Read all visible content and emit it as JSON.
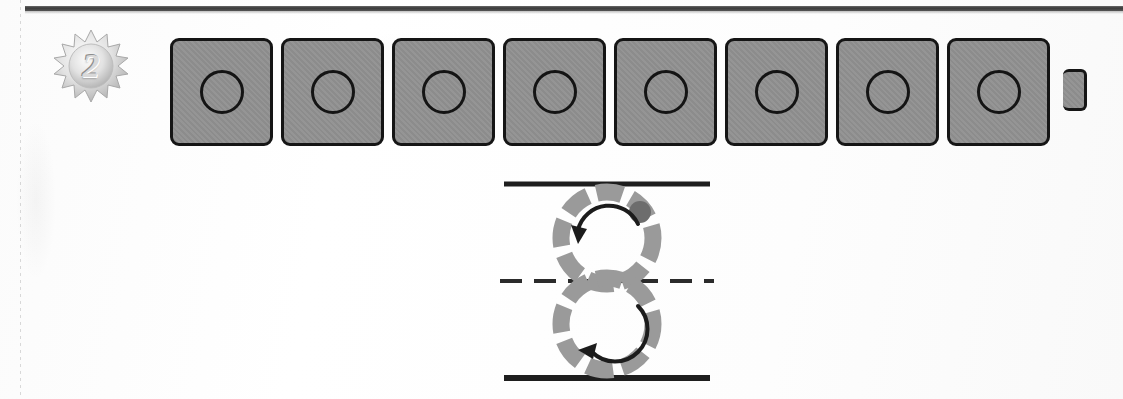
{
  "figure": {
    "panel_number": "2",
    "badge": {
      "icon": "sunburst-badge-icon",
      "label": "2"
    },
    "top_rule": {
      "visible": true,
      "style": "solid"
    }
  },
  "strip": {
    "name": "perforated-tile-strip",
    "tile_count": 8,
    "tile_fill": "#919191",
    "tile_border": "#151515",
    "hole_shape": "circle",
    "hole_border": "#141414",
    "has_end_tab": true,
    "tiles": [
      {
        "index": 1,
        "label": "",
        "hole": "circle"
      },
      {
        "index": 2,
        "label": "",
        "hole": "circle"
      },
      {
        "index": 3,
        "label": "",
        "hole": "circle"
      },
      {
        "index": 4,
        "label": "",
        "hole": "circle"
      },
      {
        "index": 5,
        "label": "",
        "hole": "circle"
      },
      {
        "index": 6,
        "label": "",
        "hole": "circle"
      },
      {
        "index": 7,
        "label": "",
        "hole": "circle"
      },
      {
        "index": 8,
        "label": "",
        "hole": "circle"
      }
    ]
  },
  "diagram": {
    "name": "counter-rotating-wheels-diagram",
    "segment_color": "#9a9a9a",
    "marker_color": "#6d6d6d",
    "line_color": "#1e1e1e",
    "lines": [
      {
        "id": "top-rail",
        "style": "solid",
        "label": ""
      },
      {
        "id": "center-axis",
        "style": "dashed",
        "label": ""
      },
      {
        "id": "bottom-rail",
        "style": "solid",
        "label": ""
      }
    ],
    "wheels": [
      {
        "id": "upper-wheel",
        "segments": 8,
        "rotation": "counter-clockwise",
        "arrow": "curved-arrow-ccw",
        "marker": {
          "present": true,
          "position": "upper-right"
        }
      },
      {
        "id": "lower-wheel",
        "segments": 8,
        "rotation": "counter-clockwise",
        "arrow": "curved-arrow-ccw",
        "marker": {
          "present": false,
          "position": ""
        }
      }
    ]
  },
  "colors": {
    "paper": "#fefefe",
    "ink": "#1e1e1e",
    "tile_gray": "#919191",
    "segment_gray": "#9a9a9a",
    "marker_gray": "#6d6d6d"
  }
}
